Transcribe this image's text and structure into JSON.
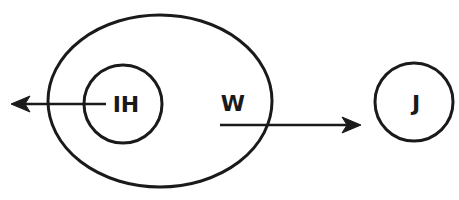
{
  "diagram": {
    "type": "set-diagram",
    "colors": {
      "stroke": "#1a1a1a",
      "background": "#ffffff"
    },
    "nodes": [
      {
        "id": "W",
        "label": "W",
        "shape": "ellipse",
        "cx": 160,
        "cy": 101,
        "rx": 112,
        "ry": 86
      },
      {
        "id": "IH",
        "label": "IH",
        "shape": "circle",
        "cx": 123,
        "cy": 104,
        "r": 39,
        "contained_in": "W"
      },
      {
        "id": "J",
        "label": "J",
        "shape": "circle",
        "cx": 414,
        "cy": 102,
        "r": 39
      }
    ],
    "labels": {
      "ih": "IH",
      "w": "W",
      "j": "J"
    },
    "edges": [
      {
        "from": "IH",
        "direction": "left",
        "x1": 106,
        "y1": 104,
        "x2": 11,
        "y2": 104,
        "description": "arrow from IH pointing left out of W"
      },
      {
        "from": "W",
        "to": "J",
        "direction": "right",
        "x1": 220,
        "y1": 125,
        "x2": 361,
        "y2": 125,
        "description": "arrow from W pointing right toward J"
      }
    ]
  }
}
